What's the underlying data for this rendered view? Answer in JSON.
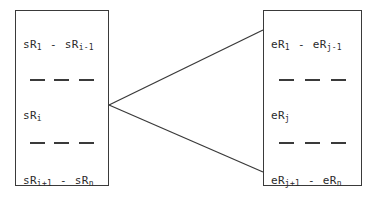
{
  "diagram": {
    "type": "two-box-fan-connector",
    "background_color": "#ffffff",
    "stroke_color": "#3a3a3a",
    "text_color": "#2b2b2b",
    "left_box": {
      "name": "source-rules-box",
      "segments": [
        {
          "id": "s-top",
          "text": "sR1 - sRi-1",
          "base_left": "sR",
          "sub_left": "1",
          "separator": "-",
          "base_right": "sR",
          "sub_right": "i-1"
        },
        {
          "id": "s-mid",
          "text": "sRi",
          "base_left": "sR",
          "sub_left": "i",
          "separator": "",
          "base_right": "",
          "sub_right": ""
        },
        {
          "id": "s-bottom",
          "text": "sRi+1 - sRn",
          "base_left": "sR",
          "sub_left": "i+1",
          "separator": "-",
          "base_right": "sR",
          "sub_right": "n"
        }
      ],
      "ellipsis_rows": 2,
      "ellipsis_dashes_per_row": 3
    },
    "right_box": {
      "name": "expanded-rules-box",
      "segments": [
        {
          "id": "e-top",
          "text": "eR1 - eRj-1",
          "base_left": "eR",
          "sub_left": "1",
          "separator": "-",
          "base_right": "eR",
          "sub_right": "j-1"
        },
        {
          "id": "e-mid",
          "text": "eRj",
          "base_left": "eR",
          "sub_left": "j",
          "separator": "",
          "base_right": "",
          "sub_right": ""
        },
        {
          "id": "e-bottom",
          "text": "eRj+1 - eRn",
          "base_left": "eR",
          "sub_left": "j+1",
          "separator": "-",
          "base_right": "eR",
          "sub_right": "n"
        }
      ],
      "ellipsis_rows": 2,
      "ellipsis_dashes_per_row": 3
    },
    "connectors": [
      {
        "id": "upper-connector",
        "from_x": 109,
        "from_y": 105,
        "to_x": 263,
        "to_y": 30
      },
      {
        "id": "lower-connector",
        "from_x": 109,
        "from_y": 105,
        "to_x": 263,
        "to_y": 172
      }
    ]
  }
}
